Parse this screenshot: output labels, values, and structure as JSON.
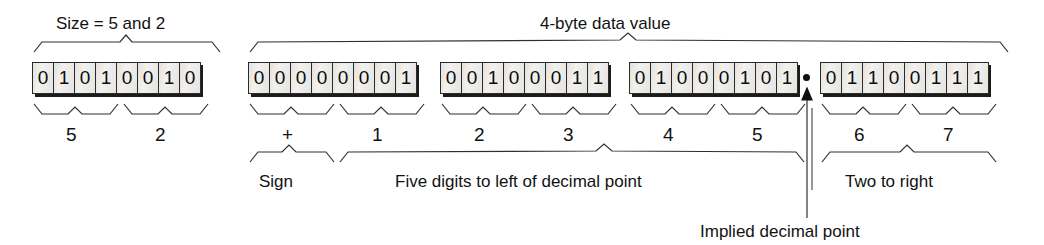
{
  "diagram": {
    "title_left": "Size = 5 and 2",
    "title_right": "4-byte data value",
    "caption": "Implied decimal point"
  },
  "bytes": [
    {
      "name": "size-byte",
      "bits": [
        "0",
        "1",
        "0",
        "1",
        "0",
        "0",
        "1",
        "0"
      ]
    },
    {
      "name": "data-byte-1",
      "bits": [
        "0",
        "0",
        "0",
        "0",
        "0",
        "0",
        "0",
        "1"
      ]
    },
    {
      "name": "data-byte-2",
      "bits": [
        "0",
        "0",
        "1",
        "0",
        "0",
        "0",
        "1",
        "1"
      ]
    },
    {
      "name": "data-byte-3",
      "bits": [
        "0",
        "1",
        "0",
        "0",
        "0",
        "1",
        "0",
        "1"
      ]
    },
    {
      "name": "data-byte-4",
      "bits": [
        "0",
        "1",
        "1",
        "0",
        "0",
        "1",
        "1",
        "1"
      ]
    }
  ],
  "nibble_labels": [
    "5",
    "2",
    "+",
    "1",
    "2",
    "3",
    "4",
    "5",
    "6",
    "7"
  ],
  "bottom_labels": {
    "sign": "Sign",
    "left_of_point": "Five digits to left of decimal point",
    "right_of_point": "Two to right"
  },
  "colors": {
    "ink": "#121212",
    "box_fill": "#eceae6",
    "box_border": "#2b2b2b",
    "shadow": "#1b1b1b"
  }
}
